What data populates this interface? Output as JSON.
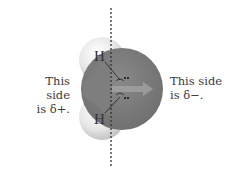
{
  "diagram": {
    "left_label": {
      "line1": "This side",
      "line2": "is δ+."
    },
    "right_label": {
      "line1": "This side",
      "line2": "is δ−."
    },
    "atoms": {
      "hydrogen_top": "H",
      "hydrogen_bottom": "H"
    },
    "colors": {
      "oxygen": "#7b7b7b",
      "hydrogen": "#e8e8e8",
      "arrow": "#9c9c9c",
      "dashed_line": "#333333",
      "background": "#ffffff"
    }
  }
}
